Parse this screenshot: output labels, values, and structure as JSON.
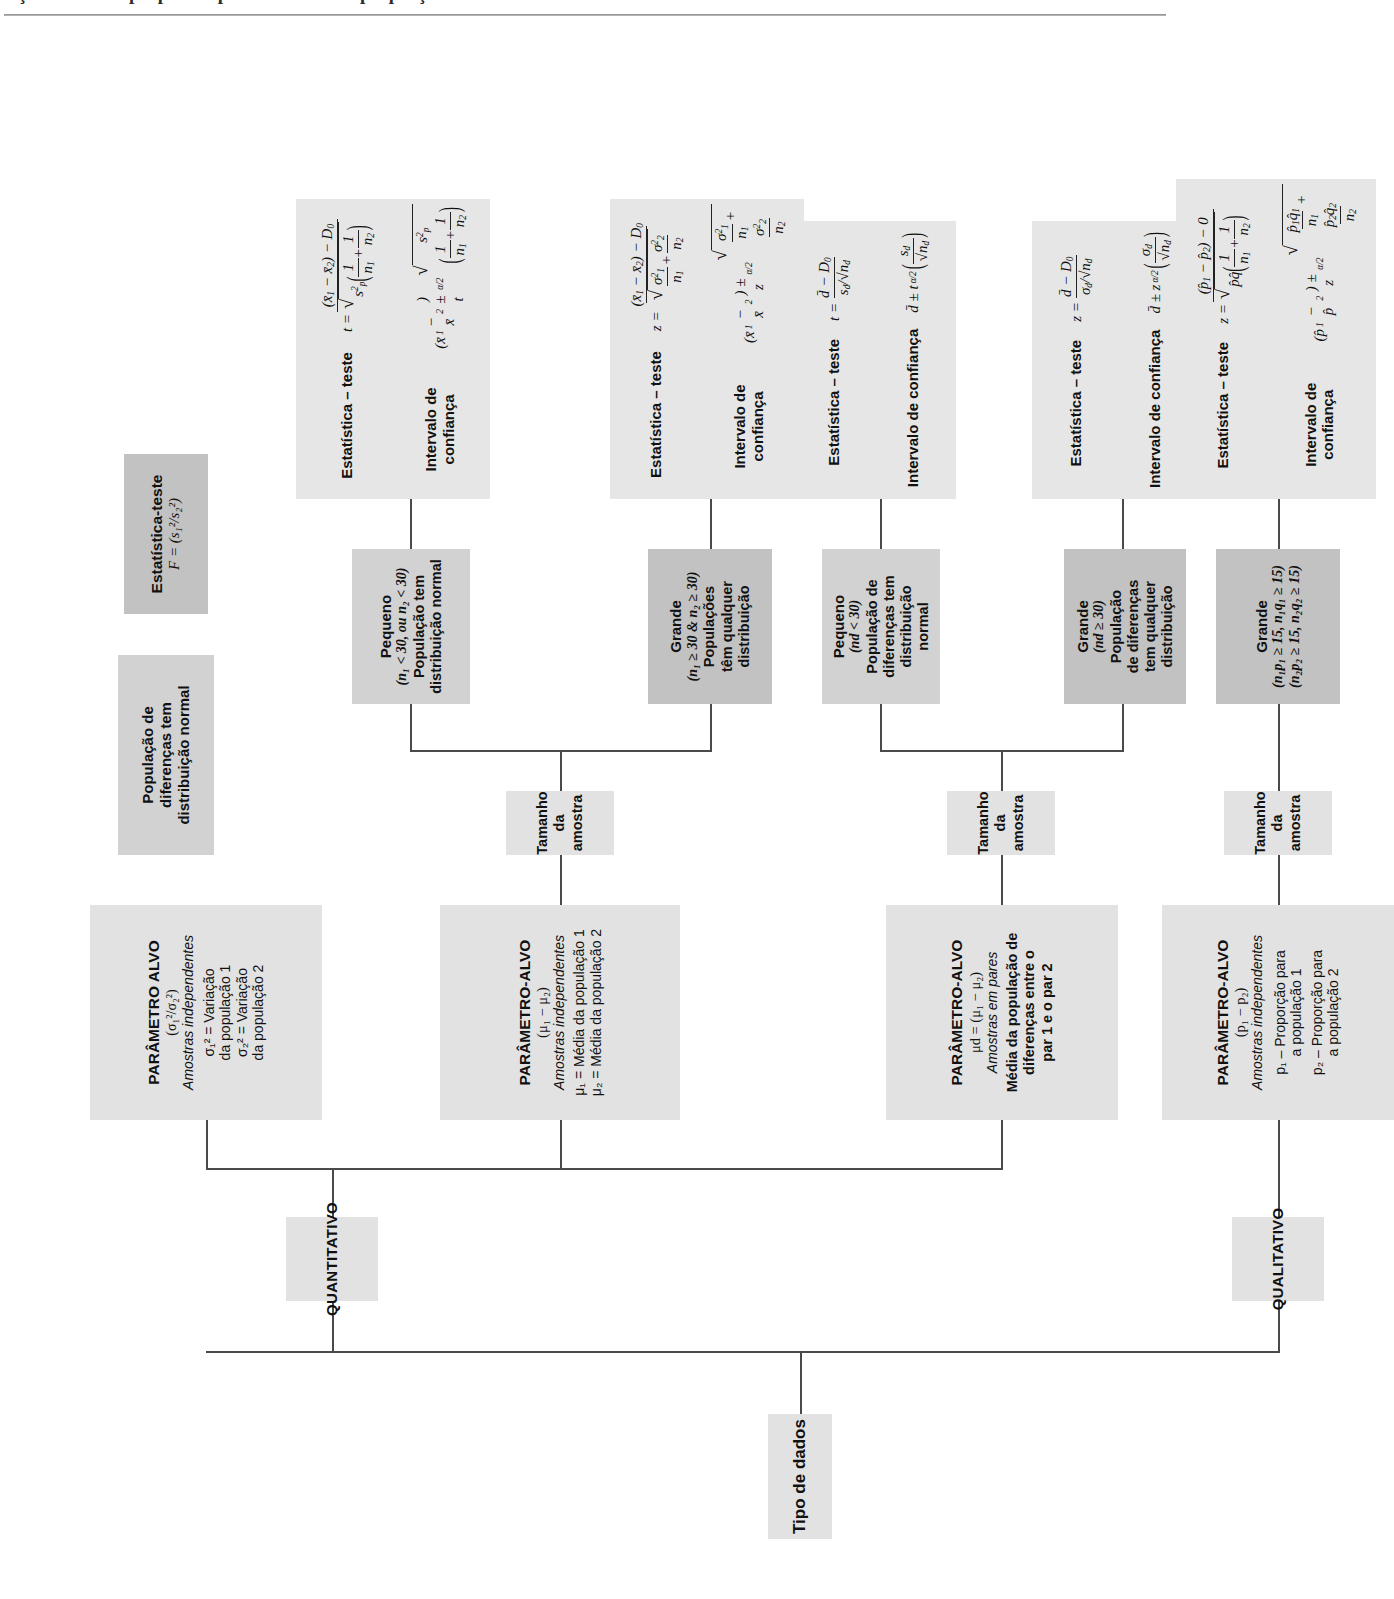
{
  "page": {
    "header_text_partial": "ção do teste apropriado para a média e a proporção"
  },
  "diagram": {
    "title_root": "Tipo de dados",
    "branches": {
      "quantitativo": "QUANTITATIVO",
      "qualitativo": "QUALITATIVO"
    },
    "sample_size_label": "Tamanho da amostra",
    "nodes": {
      "var_ratio": {
        "title": "PARÂMETRO ALVO",
        "param": "(σ₁²/σ₂²)",
        "subtitle": "Amostras independentes",
        "line1": "σ₁² = Variação",
        "line2": "da população 1",
        "line3": "σ₂² = Variação",
        "line4": "da população 2"
      },
      "var_assumption": {
        "line1": "População de",
        "line2": "diferenças tem",
        "line3": "distribuição normal"
      },
      "var_stat": {
        "title": "Estatística-teste",
        "formula": "F = (s₁²/s₂²)"
      },
      "mu_diff": {
        "title": "PARÂMETRO-ALVO",
        "param": "(μ₁ − μ₂)",
        "subtitle": "Amostras independentes",
        "line1": "μ₁ = Média da população 1",
        "line2": "μ₂ = Média da população 2"
      },
      "mu_small": {
        "title": "Pequeno",
        "cond": "(n₁ < 30, ou n₂ < 30)",
        "line1": "População tem",
        "line2": "distribuição normal"
      },
      "mu_large": {
        "title": "Grande",
        "cond": "(n₁ ≥ 30 & n₂ ≥ 30)",
        "line1": "Populações",
        "line2": "têm qualquer",
        "line3": "distribuição"
      },
      "mu_small_formula": {
        "stat_label": "Estatística – teste",
        "stat": "t = ((x̄₁ − x̄₂) − D₀) / √(s²p(1/n₁ + 1/n₂))",
        "ci_label": "Intervalo de confiança",
        "ci": "(x̄₁ − x̄₂) ± t(α/2) √(s²p(1/n₁ + 1/n₂))"
      },
      "mu_large_formula": {
        "stat_label": "Estatística – teste",
        "stat": "z = ((x̄₁ − x̄₂) − D₀) / √(σ₁²/n₁ + σ₂²/n₂)",
        "ci_label": "Intervalo de confiança",
        "ci": "(x̄₁ − x̄₂) ± z(α/2) √(σ₁²/n₁ + σ₂²/n₂)"
      },
      "mu_d": {
        "title": "PARÂMETRO-ALVO",
        "param": "μd = (μ₁ − μ₂)",
        "subtitle": "Amostras em pares",
        "line1": "Média da população de",
        "line2": "diferenças entre o",
        "line3": "par 1 e o par 2"
      },
      "mud_small": {
        "title": "Pequeno",
        "cond": "(nd < 30)",
        "line1": "População de",
        "line2": "diferenças tem",
        "line3": "distribuição",
        "line4": "normal"
      },
      "mud_large": {
        "title": "Grande",
        "cond": "(nd ≥ 30)",
        "line1": "População",
        "line2": "de diferenças",
        "line3": "tem qualquer",
        "line4": "distribuição"
      },
      "mud_small_formula": {
        "stat_label": "Estatística – teste",
        "stat": "t = (d̄ − D₀) / (sd/√nd)",
        "ci_label": "Intervalo de confiança",
        "ci": "d̄ ± t(α/2) (sd/√nd)"
      },
      "mud_large_formula": {
        "stat_label": "Estatística – teste",
        "stat": "z = (d̄ − D₀) / (σd/√nd)",
        "ci_label": "Intervalo de confiança",
        "ci": "d̄ ± z(α/2) (σd/√nd)"
      },
      "prop_diff": {
        "title": "PARÂMETRO-ALVO",
        "param": "(p₁ − p₂)",
        "subtitle": "Amostras independentes",
        "line1": "p₁ – Proporção para",
        "line2": "a população 1",
        "line3": "p₂ – Proporção para",
        "line4": "a população 2"
      },
      "prop_large": {
        "title": "Grande",
        "cond1": "(n₁p₁ ≥ 15, n₁q₁ ≥ 15)",
        "cond2": "(n₂p₂ ≥ 15, n₂q₂ ≥ 15)"
      },
      "prop_formula": {
        "stat_label": "Estatística – teste",
        "stat": "z = ((p̂₁ − p̂₂) − 0) / √(p̂q̂(1/n₁ + 1/n₂))",
        "ci_label": "Intervalo de confiança",
        "ci": "(p̂₁ − p̂₂) ± z(α/2) √(p̂₁q̂₁/n₁ + p̂₂q̂₂/n₂)"
      }
    },
    "colors": {
      "node_light": "#e2e2e2",
      "node_mid": "#d2d2d2",
      "node_dark": "#c2c2c2",
      "formula_bg": "#e6e6e6",
      "connector": "#4a4a4a",
      "page_background": "#ffffff"
    }
  }
}
